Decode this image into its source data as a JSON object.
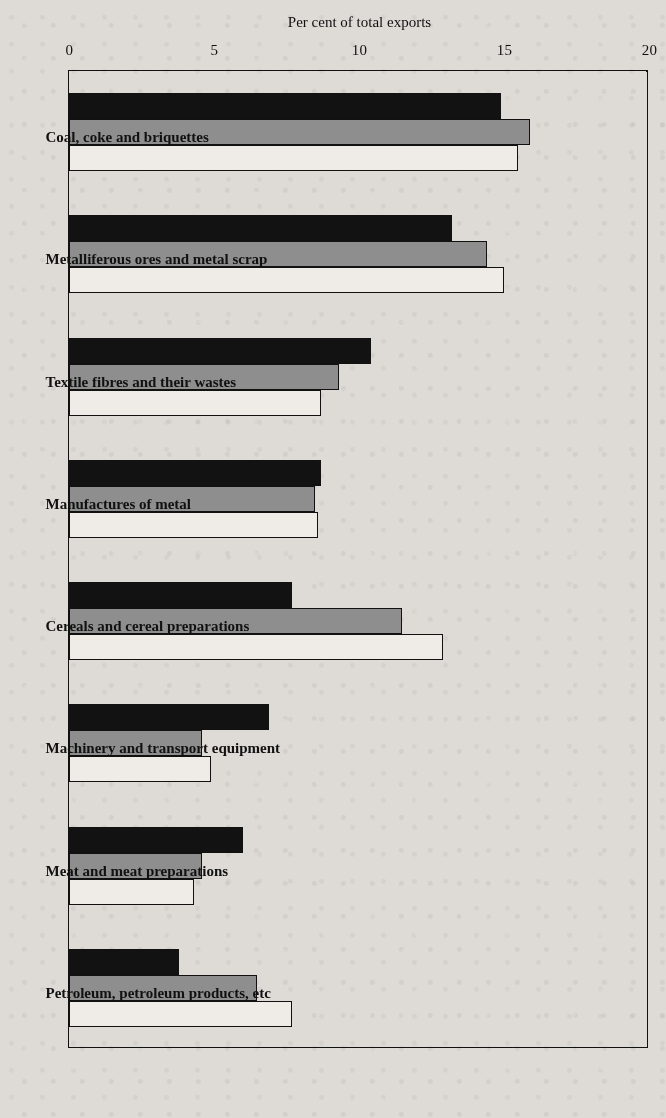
{
  "chart_data": {
    "type": "bar",
    "title": "",
    "xlabel": "",
    "ylabel": "Per cent of total exports",
    "ylim": [
      0,
      20
    ],
    "yticks": [
      "0",
      "5",
      "10",
      "15",
      "20"
    ],
    "ytick_values": [
      0,
      5,
      10,
      15,
      20
    ],
    "grid": true,
    "orientation": "rotated-90",
    "legend_position": "none",
    "categories": [
      "Coal, coke and briquettes",
      "Metalliferous ores and metal scrap",
      "Textile fibres and their wastes",
      "Manufactures of metal",
      "Cereals and cereal preparations",
      "Machinery and transport equipment",
      "Meat and meat preparations",
      "Petroleum, petroleum products, etc"
    ],
    "series": [
      {
        "name": "series-1",
        "color": "#121212",
        "values": [
          14.9,
          13.2,
          10.4,
          8.7,
          7.7,
          6.9,
          6.0,
          3.8
        ]
      },
      {
        "name": "series-2",
        "color": "#8e8e8e",
        "values": [
          15.9,
          14.4,
          9.3,
          8.5,
          11.5,
          4.6,
          4.6,
          6.5
        ]
      },
      {
        "name": "series-3",
        "color": "#efece7",
        "values": [
          15.5,
          15.0,
          8.7,
          8.6,
          12.9,
          4.9,
          4.3,
          7.7
        ]
      }
    ]
  }
}
